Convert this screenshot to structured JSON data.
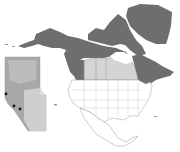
{
  "map": {
    "title": "",
    "region": "North America",
    "inset_region": "Alberta",
    "colors": {
      "background": "#ffffff",
      "highlighted_range": "#6e6e6e",
      "canada_prairies": "#d4d4d4",
      "usa_mexico_fill": "#ffffff",
      "borders": "#9a9a9a",
      "inset_fill_dark": "#a8a8a8",
      "inset_fill_light": "#d6d6d6",
      "inset_points": "#1a1a1a"
    },
    "legend": [],
    "inset_points": [
      {
        "x": 6,
        "y": 94
      },
      {
        "x": 14,
        "y": 106
      },
      {
        "x": 20,
        "y": 109
      }
    ]
  }
}
